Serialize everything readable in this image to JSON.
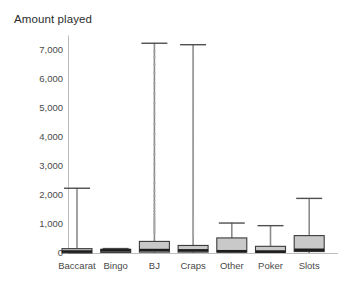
{
  "chart_data": {
    "type": "box",
    "title": "Amount played",
    "xlabel": "",
    "ylabel": "",
    "ylim": [
      0,
      7600
    ],
    "grid": false,
    "legend": null,
    "yticks": [
      0,
      1000,
      2000,
      3000,
      4000,
      5000,
      6000,
      7000
    ],
    "ytick_labels": [
      "0",
      "1,000",
      "2,000",
      "3,000",
      "4,000",
      "5,000",
      "6,000",
      "7,000"
    ],
    "categories": [
      "Baccarat",
      "Bingo",
      "BJ",
      "Craps",
      "Other",
      "Poker",
      "Slots"
    ],
    "boxes": [
      {
        "category": "Baccarat",
        "whisker_low": 0,
        "q1": 0,
        "median": 50,
        "q3": 150,
        "whisker_high": 2250,
        "outliers": []
      },
      {
        "category": "Bingo",
        "whisker_low": 0,
        "q1": 20,
        "median": 90,
        "q3": 130,
        "whisker_high": 170,
        "outliers": []
      },
      {
        "category": "BJ",
        "whisker_low": 0,
        "q1": 30,
        "median": 100,
        "q3": 400,
        "whisker_high": 7250,
        "outliers": [
          700,
          760,
          820,
          880,
          940,
          1010,
          1080,
          1150,
          1240,
          1330,
          1430,
          1540,
          1660,
          1800,
          1960,
          2150,
          2400,
          2700,
          3050,
          3400,
          3750,
          4100,
          4450,
          4800,
          5150,
          5500,
          5850,
          6200,
          6500,
          6750,
          6950
        ]
      },
      {
        "category": "Craps",
        "whisker_low": 0,
        "q1": 30,
        "median": 90,
        "q3": 260,
        "whisker_high": 7200,
        "outliers": [
          600,
          660,
          720,
          790,
          860,
          940,
          1030,
          1120,
          1220,
          1330,
          1460,
          1600,
          1760,
          1940,
          2150,
          2400,
          2700,
          3050,
          3400,
          3750,
          4100,
          4450,
          4800,
          5150,
          5500,
          5850,
          6200,
          6500,
          6780,
          6950
        ]
      },
      {
        "category": "Other",
        "whisker_low": 0,
        "q1": 30,
        "median": 60,
        "q3": 520,
        "whisker_high": 1050,
        "outliers": []
      },
      {
        "category": "Poker",
        "whisker_low": 0,
        "q1": 20,
        "median": 50,
        "q3": 230,
        "whisker_high": 960,
        "outliers": []
      },
      {
        "category": "Slots",
        "whisker_low": 0,
        "q1": 50,
        "median": 110,
        "q3": 600,
        "whisker_high": 1900,
        "outliers": []
      }
    ],
    "colors": {
      "box_fill": "#c9c9c9",
      "box_stroke": "#3a3a3a",
      "median": "#1e1e1e",
      "whisker": "#8c8c8c",
      "outlier": "#a8a8a8",
      "axis": "#bdbdbd",
      "text": "#4a4a4a",
      "background": "#ffffff"
    }
  }
}
